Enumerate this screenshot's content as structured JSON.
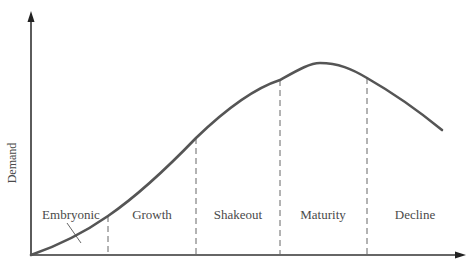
{
  "diagram": {
    "type": "industry-life-cycle-curve",
    "axes": {
      "y_label": "Demand",
      "x_label": ""
    },
    "stages": [
      {
        "label": "Embryonic",
        "x": 71
      },
      {
        "label": "Growth",
        "x": 152
      },
      {
        "label": "Shakeout",
        "x": 238
      },
      {
        "label": "Maturity",
        "x": 323
      },
      {
        "label": "Decline",
        "x": 415
      }
    ],
    "dividers_x": [
      108,
      196,
      280,
      367
    ],
    "curve_points": [
      [
        31,
        255
      ],
      [
        108,
        216
      ],
      [
        196,
        138
      ],
      [
        280,
        80
      ],
      [
        320,
        63
      ],
      [
        367,
        78
      ],
      [
        442,
        128
      ]
    ],
    "colors": {
      "curve": "#555555",
      "axis": "#333333",
      "divider": "#666666",
      "text": "#4a4a4a",
      "background": "#ffffff"
    }
  }
}
